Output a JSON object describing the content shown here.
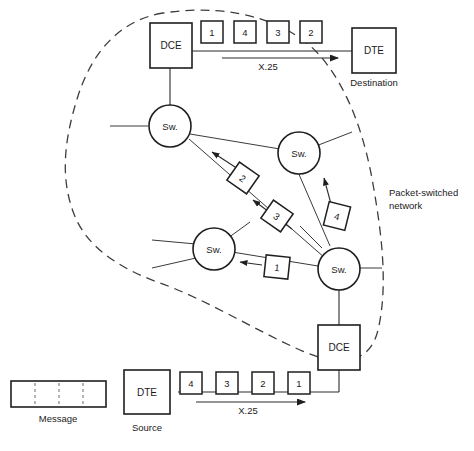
{
  "figure": {
    "cloud_label_line1": "Packet-switched",
    "cloud_label_line2": "network"
  },
  "nodes": {
    "dce_top": {
      "label": "DCE"
    },
    "dce_bottom": {
      "label": "DCE"
    },
    "dte_destination": {
      "label": "DTE",
      "caption": "Destination"
    },
    "dte_source": {
      "label": "DTE",
      "caption": "Source"
    },
    "switches": [
      {
        "label": "Sw."
      },
      {
        "label": "Sw."
      },
      {
        "label": "Sw."
      },
      {
        "label": "Sw."
      }
    ]
  },
  "message": {
    "caption": "Message",
    "segments": 4
  },
  "protocol": {
    "top_link_label": "X.25",
    "bottom_link_label": "X.25"
  },
  "packets": {
    "top_row": [
      "1",
      "4",
      "3",
      "2"
    ],
    "bottom_row": [
      "4",
      "3",
      "2",
      "1"
    ],
    "in_network": [
      "2",
      "3",
      "4",
      "1"
    ]
  },
  "colors": {
    "line": "#2b2b2b",
    "box_stroke": "#1f1f1f",
    "cloud_stroke": "#3d3d3d",
    "text": "#1a1a1a",
    "background": "#ffffff"
  }
}
